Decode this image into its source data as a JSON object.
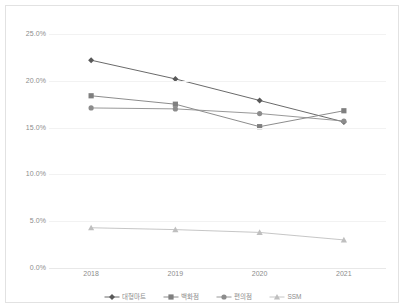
{
  "chart_data": {
    "type": "line",
    "title": "",
    "subtitle": "",
    "xlabel": "",
    "ylabel": "",
    "categories": [
      "2018",
      "2019",
      "2020",
      "2021"
    ],
    "ylim": [
      0,
      25
    ],
    "ytick_labels": [
      "25.0%",
      "20.0%",
      "15.0%",
      "10.0%",
      "5.0%",
      "0.0%"
    ],
    "ytick_values": [
      25,
      20,
      15,
      10,
      5,
      0
    ],
    "grid": true,
    "legend_position": "bottom-center",
    "series": [
      {
        "name": "대형마트",
        "marker": "diamond",
        "color": "#595959",
        "values": [
          22.2,
          20.2,
          17.9,
          15.6
        ]
      },
      {
        "name": "백화점",
        "marker": "square",
        "color": "#7f7f7f",
        "values": [
          18.4,
          17.5,
          15.1,
          16.8
        ]
      },
      {
        "name": "편의점",
        "marker": "circle",
        "color": "#8c8c8c",
        "values": [
          17.1,
          17.0,
          16.5,
          15.7
        ]
      },
      {
        "name": "SSM",
        "marker": "triangle",
        "color": "#bfbfbf",
        "values": [
          4.3,
          4.1,
          3.8,
          3.0
        ]
      }
    ]
  },
  "legend": {
    "items": [
      {
        "label": "대형마트"
      },
      {
        "label": "백화점"
      },
      {
        "label": "편의점"
      },
      {
        "label": "SSM"
      }
    ]
  },
  "colors": {
    "frame_border": "#e2e2e2",
    "gridline": "#f2f2f2",
    "axis_text": "#8c8c8c",
    "background": "#ffffff"
  }
}
